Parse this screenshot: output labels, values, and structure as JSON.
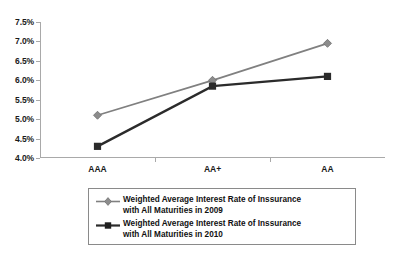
{
  "chart_data": {
    "type": "line",
    "title": "",
    "xlabel": "",
    "ylabel": "",
    "categories": [
      "AAA",
      "AA+",
      "AA"
    ],
    "ylim": [
      4.0,
      7.5
    ],
    "ytick_labels": [
      "7.5%",
      "7.0%",
      "6.5%",
      "6.0%",
      "5.5%",
      "5.0%",
      "4.5%",
      "4.0%"
    ],
    "ytick_values": [
      7.5,
      7.0,
      6.5,
      6.0,
      5.5,
      5.0,
      4.5,
      4.0
    ],
    "grid": false,
    "legend_position": "bottom",
    "series": [
      {
        "name": "Weighted Average Interest Rate of Inssurance with All Maturities in 2009",
        "label_line1": "Weighted Average Interest Rate of Inssurance",
        "label_line2": "with All Maturities in 2009",
        "values": [
          5.1,
          6.0,
          6.95
        ],
        "color": "#808080",
        "marker": "diamond"
      },
      {
        "name": "Weighted Average Interest Rate of Inssurance with All Maturities in 2010",
        "label_line1": "Weighted Average Interest Rate of Inssurance",
        "label_line2": "with All Maturities in 2010",
        "values": [
          4.3,
          5.85,
          6.1
        ],
        "color": "#2b2b2b",
        "marker": "square"
      }
    ]
  },
  "colors": {
    "axis": "#a9a9a9",
    "text": "#1a1a1a",
    "legend_border": "#8a8a8a",
    "background": "#ffffff"
  }
}
